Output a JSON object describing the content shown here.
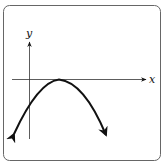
{
  "diagram": {
    "type": "function-graph",
    "axes": {
      "x_label": "x",
      "y_label": "y"
    },
    "curve": {
      "shape": "parabola",
      "opens": "down",
      "vertex_on_x_axis": true,
      "end_arrows": true
    }
  }
}
